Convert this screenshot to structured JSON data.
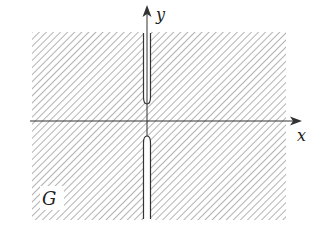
{
  "figure": {
    "region_label": "G",
    "x_axis_label": "x",
    "y_axis_label": "y",
    "colors": {
      "hatch": "#8a8a8a",
      "axis": "#333333",
      "slit_outline": "#333333",
      "background": "#ffffff"
    }
  }
}
